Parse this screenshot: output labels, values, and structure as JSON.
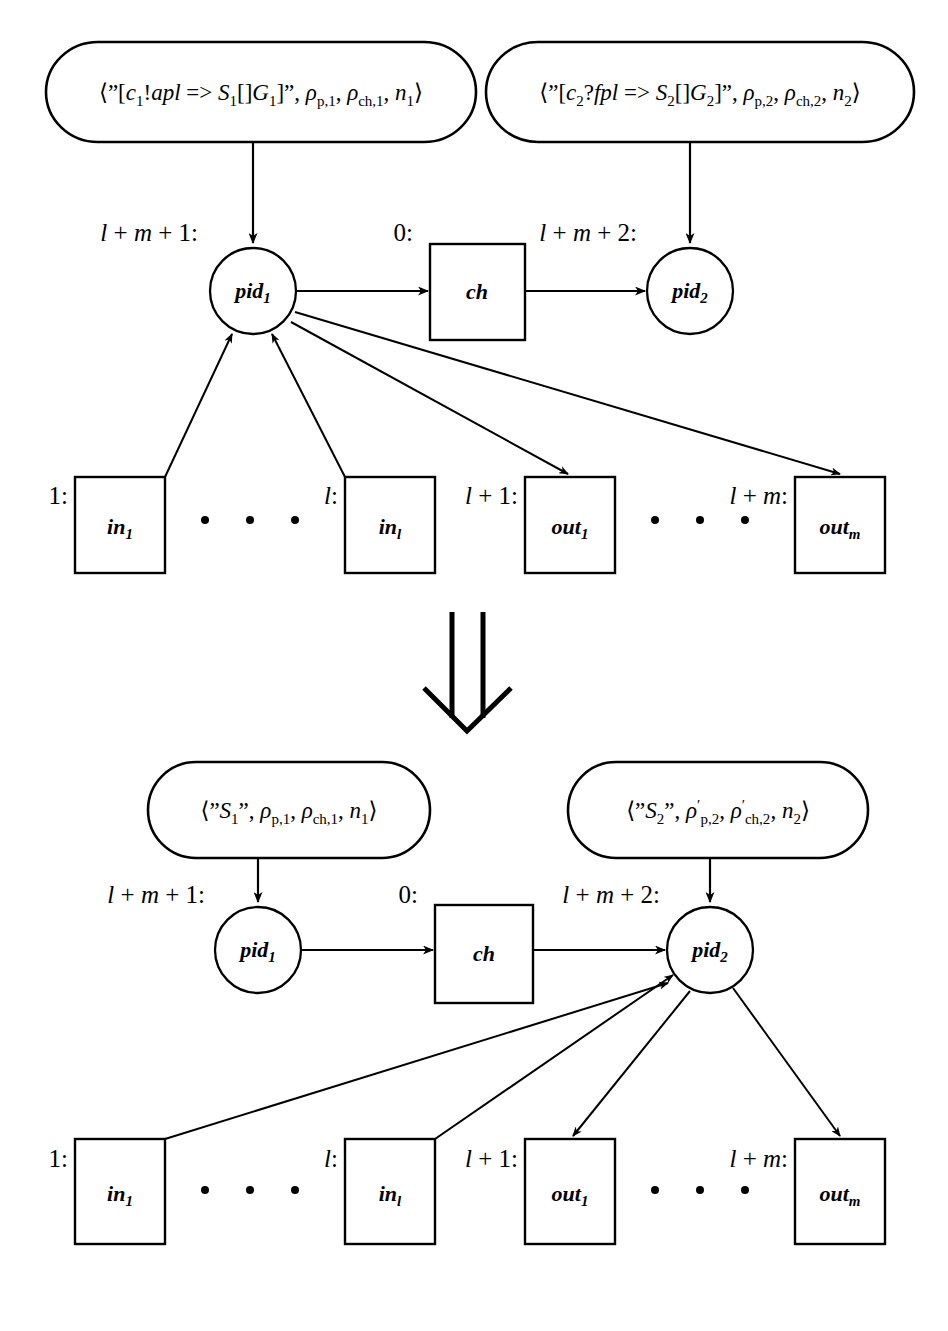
{
  "page": {
    "folio": "",
    "background_color": "#ffffff",
    "ink_color": "#000000",
    "width": 948,
    "height": 1331
  },
  "transition_arrow": {
    "name": "double-down-arrow",
    "glyph": "⇓",
    "meaning": "rewrites to"
  },
  "upper": {
    "caption": "before-state",
    "state_boxes": [
      {
        "id": "state-1",
        "text": "⟨\"[c₁!apl => S₁[]G₁]\", ρ_p,1, ρ_ch,1, n₁⟩",
        "parts": {
          "open": "⟨\"[",
          "guard": "c",
          "guard_sub": "1",
          "op": "!",
          "arg": "apl",
          "arrow": "=>",
          "cont": "S",
          "cont_sub": "1",
          "box_op": "[]",
          "g": "G",
          "g_sub": "1",
          "close_quote": "]\",",
          "rho_p": "ρ",
          "rho_p_sub": "p,1",
          "rho_ch": "ρ",
          "rho_ch_sub": "ch,1",
          "n": "n",
          "n_sub": "1",
          "close": "⟩"
        }
      },
      {
        "id": "state-2",
        "text": "⟨\"[c₂?fpl => S₂[]G₂]\", ρ_p,2, ρ_ch,2, n₂⟩",
        "parts": {
          "open": "⟨\"[",
          "guard": "c",
          "guard_sub": "2",
          "op": "?",
          "arg": "fpl",
          "arrow": "=>",
          "cont": "S",
          "cont_sub": "2",
          "box_op": "[]",
          "g": "G",
          "g_sub": "2",
          "close_quote": "]\",",
          "rho_p": "ρ",
          "rho_p_sub": "p,2",
          "rho_ch": "ρ",
          "rho_ch_sub": "ch,2",
          "n": "n",
          "n_sub": "2",
          "close": "⟩"
        }
      }
    ],
    "nodes": [
      {
        "id": "pid1",
        "label": "pid",
        "sub": "1",
        "index_label": "l + m + 1:",
        "shape": "circle"
      },
      {
        "id": "ch",
        "label": "ch",
        "sub": "",
        "index_label": "0:",
        "shape": "rect"
      },
      {
        "id": "pid2",
        "label": "pid",
        "sub": "2",
        "index_label": "l + m + 2:",
        "shape": "circle"
      }
    ],
    "ports": [
      {
        "id": "in1",
        "label": "in",
        "sub": "1",
        "index_label": "1:",
        "kind": "in"
      },
      {
        "id": "inl",
        "label": "in",
        "sub": "l",
        "index_label": "l:",
        "kind": "in"
      },
      {
        "id": "out1",
        "label": "out",
        "sub": "1",
        "index_label": "l + 1:",
        "kind": "out"
      },
      {
        "id": "outm",
        "label": "out",
        "sub": "m",
        "index_label": "l + m:",
        "kind": "out"
      }
    ],
    "ellipsis_dots": 3,
    "edges": [
      {
        "from": "state-1",
        "to": "pid1",
        "dir": "down"
      },
      {
        "from": "state-2",
        "to": "pid2",
        "dir": "down"
      },
      {
        "from": "pid1",
        "to": "ch",
        "dir": "right"
      },
      {
        "from": "ch",
        "to": "pid2",
        "dir": "right"
      },
      {
        "from": "in1",
        "to": "pid1",
        "dir": "up"
      },
      {
        "from": "inl",
        "to": "pid1",
        "dir": "up"
      },
      {
        "from": "pid1",
        "to": "out1",
        "dir": "down-right"
      },
      {
        "from": "pid1",
        "to": "outm",
        "dir": "down-right"
      }
    ]
  },
  "lower": {
    "caption": "after-state",
    "state_boxes": [
      {
        "id": "state-1p",
        "text": "⟨\"S₁\", ρ_p,1, ρ_ch,1, n₁⟩",
        "parts": {
          "open": "⟨\"",
          "s": "S",
          "s_sub": "1",
          "close_quote": "\",",
          "rho_p": "ρ",
          "rho_p_prime": "",
          "rho_p_sub": "p,1",
          "rho_ch": "ρ",
          "rho_ch_prime": "",
          "rho_ch_sub": "ch,1",
          "n": "n",
          "n_sub": "1",
          "close": "⟩"
        }
      },
      {
        "id": "state-2p",
        "text": "⟨\"S₂\", ρ′_p,2, ρ′_ch,2, n₂⟩",
        "parts": {
          "open": "⟨\"",
          "s": "S",
          "s_sub": "2",
          "close_quote": "\",",
          "rho_p": "ρ",
          "rho_p_prime": "′",
          "rho_p_sub": "p,2",
          "rho_ch": "ρ",
          "rho_ch_prime": "′",
          "rho_ch_sub": "ch,2",
          "n": "n",
          "n_sub": "2",
          "close": "⟩"
        }
      }
    ],
    "nodes": [
      {
        "id": "pid1",
        "label": "pid",
        "sub": "1",
        "index_label": "l + m + 1:",
        "shape": "circle"
      },
      {
        "id": "ch",
        "label": "ch",
        "sub": "",
        "index_label": "0:",
        "shape": "rect"
      },
      {
        "id": "pid2",
        "label": "pid",
        "sub": "2",
        "index_label": "l + m + 2:",
        "shape": "circle"
      }
    ],
    "ports": [
      {
        "id": "in1",
        "label": "in",
        "sub": "1",
        "index_label": "1:",
        "kind": "in"
      },
      {
        "id": "inl",
        "label": "in",
        "sub": "l",
        "index_label": "l:",
        "kind": "in"
      },
      {
        "id": "out1",
        "label": "out",
        "sub": "1",
        "index_label": "l + 1:",
        "kind": "out"
      },
      {
        "id": "outm",
        "label": "out",
        "sub": "m",
        "index_label": "l + m:",
        "kind": "out"
      }
    ],
    "ellipsis_dots": 3,
    "edges": [
      {
        "from": "state-1p",
        "to": "pid1",
        "dir": "down"
      },
      {
        "from": "state-2p",
        "to": "pid2",
        "dir": "down"
      },
      {
        "from": "pid1",
        "to": "ch",
        "dir": "right"
      },
      {
        "from": "ch",
        "to": "pid2",
        "dir": "right"
      },
      {
        "from": "in1",
        "to": "pid2",
        "dir": "up-right"
      },
      {
        "from": "inl",
        "to": "pid2",
        "dir": "up-right"
      },
      {
        "from": "pid2",
        "to": "out1",
        "dir": "down-left"
      },
      {
        "from": "pid2",
        "to": "outm",
        "dir": "down-right"
      }
    ]
  }
}
